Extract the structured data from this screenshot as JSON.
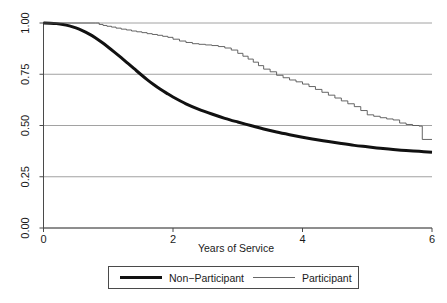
{
  "chart_data": {
    "type": "line",
    "title": "",
    "subtitle": "",
    "xlabel": "Years of Service",
    "ylabel": "",
    "xlim": [
      0,
      6
    ],
    "ylim": [
      0,
      1.0
    ],
    "grid": "horizontal",
    "xticks": [
      0,
      2,
      4,
      6
    ],
    "xtick_labels": [
      "0",
      "2",
      "4",
      "6"
    ],
    "yticks": [
      0.0,
      0.25,
      0.5,
      0.75,
      1.0
    ],
    "ytick_labels": [
      "0.00",
      "0.25",
      "0.50",
      "0.75",
      "1.00"
    ],
    "legend_position": "bottom-center",
    "series": [
      {
        "name": "Non−Participant",
        "style": "thick-smooth",
        "color": "#111111",
        "linewidth": 3.0,
        "x": [
          0.0,
          0.1,
          0.2,
          0.3,
          0.4,
          0.5,
          0.6,
          0.7,
          0.8,
          0.9,
          1.0,
          1.1,
          1.2,
          1.3,
          1.4,
          1.5,
          1.6,
          1.7,
          1.8,
          1.9,
          2.0,
          2.2,
          2.4,
          2.6,
          2.8,
          3.0,
          3.2,
          3.4,
          3.6,
          3.8,
          4.0,
          4.2,
          4.4,
          4.6,
          4.8,
          5.0,
          5.2,
          5.4,
          5.6,
          5.8,
          6.0
        ],
        "y": [
          1.0,
          0.999,
          0.997,
          0.993,
          0.986,
          0.976,
          0.963,
          0.947,
          0.928,
          0.906,
          0.882,
          0.857,
          0.831,
          0.804,
          0.777,
          0.75,
          0.724,
          0.7,
          0.678,
          0.658,
          0.639,
          0.606,
          0.579,
          0.556,
          0.535,
          0.517,
          0.5,
          0.483,
          0.468,
          0.455,
          0.443,
          0.432,
          0.422,
          0.412,
          0.403,
          0.396,
          0.389,
          0.383,
          0.378,
          0.374,
          0.37
        ]
      },
      {
        "name": "Participant",
        "style": "thin-step",
        "color": "#555555",
        "linewidth": 0.9,
        "x": [
          0.0,
          0.8,
          0.86,
          0.92,
          0.98,
          1.05,
          1.12,
          1.2,
          1.28,
          1.36,
          1.44,
          1.52,
          1.6,
          1.68,
          1.76,
          1.84,
          1.92,
          2.0,
          2.1,
          2.2,
          2.3,
          2.4,
          2.5,
          2.6,
          2.7,
          2.8,
          2.9,
          3.0,
          3.08,
          3.16,
          3.24,
          3.32,
          3.4,
          3.5,
          3.6,
          3.7,
          3.8,
          3.9,
          4.0,
          4.1,
          4.2,
          4.3,
          4.4,
          4.5,
          4.6,
          4.7,
          4.8,
          4.9,
          5.0,
          5.1,
          5.2,
          5.3,
          5.4,
          5.5,
          5.6,
          5.7,
          5.8,
          5.85,
          6.0
        ],
        "y": [
          1.0,
          1.0,
          0.993,
          0.988,
          0.984,
          0.98,
          0.975,
          0.97,
          0.966,
          0.961,
          0.957,
          0.953,
          0.948,
          0.944,
          0.94,
          0.935,
          0.93,
          0.921,
          0.912,
          0.905,
          0.899,
          0.896,
          0.893,
          0.89,
          0.885,
          0.878,
          0.868,
          0.852,
          0.838,
          0.824,
          0.809,
          0.792,
          0.775,
          0.762,
          0.745,
          0.733,
          0.722,
          0.713,
          0.702,
          0.69,
          0.676,
          0.662,
          0.648,
          0.634,
          0.62,
          0.606,
          0.592,
          0.573,
          0.552,
          0.545,
          0.538,
          0.532,
          0.527,
          0.512,
          0.505,
          0.5,
          0.497,
          0.432,
          0.432
        ]
      }
    ],
    "legend": [
      {
        "label": "Non−Participant",
        "style": "thick",
        "color": "#111111"
      },
      {
        "label": "Participant",
        "style": "thin",
        "color": "#555555"
      }
    ],
    "colors": {
      "background": "#ffffff",
      "axis": "#4a4a4a",
      "grid": "#8a8a8a",
      "non_participant": "#111111",
      "participant": "#555555",
      "legend_border": "#4a4a4a"
    }
  }
}
